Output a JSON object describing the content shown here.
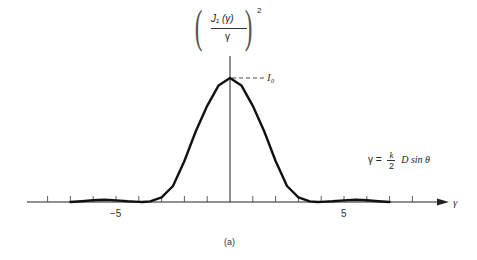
{
  "chart_data": {
    "type": "line",
    "title": "",
    "caption": "(a)",
    "xlabel": "γ",
    "ylabel": {
      "numerator": "J₁ (γ)",
      "denominator": "γ",
      "exponent": "2"
    },
    "tick_labels": [
      {
        "x": -5,
        "label": "−5"
      },
      {
        "x": 5,
        "label": "5"
      }
    ],
    "ticks": [
      -8,
      -7,
      -6,
      -5,
      -4,
      -3,
      -2,
      -1,
      1,
      2,
      3,
      4,
      5,
      6,
      7,
      8
    ],
    "xlim": [
      -9,
      10.5
    ],
    "ylim": [
      0,
      1.15
    ],
    "grid": false,
    "legend": "none",
    "annotations": [
      {
        "text": "I₀",
        "target": "peak",
        "style": "dashed-leader"
      },
      {
        "text": "γ = (k / 2) D sin θ",
        "position": "right"
      }
    ],
    "formula": {
      "lhs": "γ =",
      "frac_num": "k",
      "frac_den": "2",
      "rhs": "D sin θ"
    },
    "peak_label": "I₀",
    "series": [
      {
        "name": "(2·J1(γ)/γ)^2 normalized intensity",
        "x": [
          -7.0,
          -6.5,
          -6.0,
          -5.5,
          -5.0,
          -4.5,
          -4.0,
          -3.83,
          -3.5,
          -3.0,
          -2.5,
          -2.0,
          -1.5,
          -1.0,
          -0.5,
          0.0,
          0.5,
          1.0,
          1.5,
          2.0,
          2.5,
          3.0,
          3.5,
          3.83,
          4.0,
          4.5,
          5.0,
          5.5,
          6.0,
          6.5,
          7.0
        ],
        "y": [
          0.0,
          0.0067,
          0.0146,
          0.0175,
          0.0131,
          0.0059,
          0.0008,
          0.0,
          0.0049,
          0.0375,
          0.129,
          0.331,
          0.57,
          0.776,
          0.94,
          1.0,
          0.94,
          0.776,
          0.57,
          0.331,
          0.129,
          0.0375,
          0.0049,
          0.0,
          0.0008,
          0.0059,
          0.0131,
          0.0175,
          0.0146,
          0.0067,
          0.0
        ]
      }
    ]
  }
}
